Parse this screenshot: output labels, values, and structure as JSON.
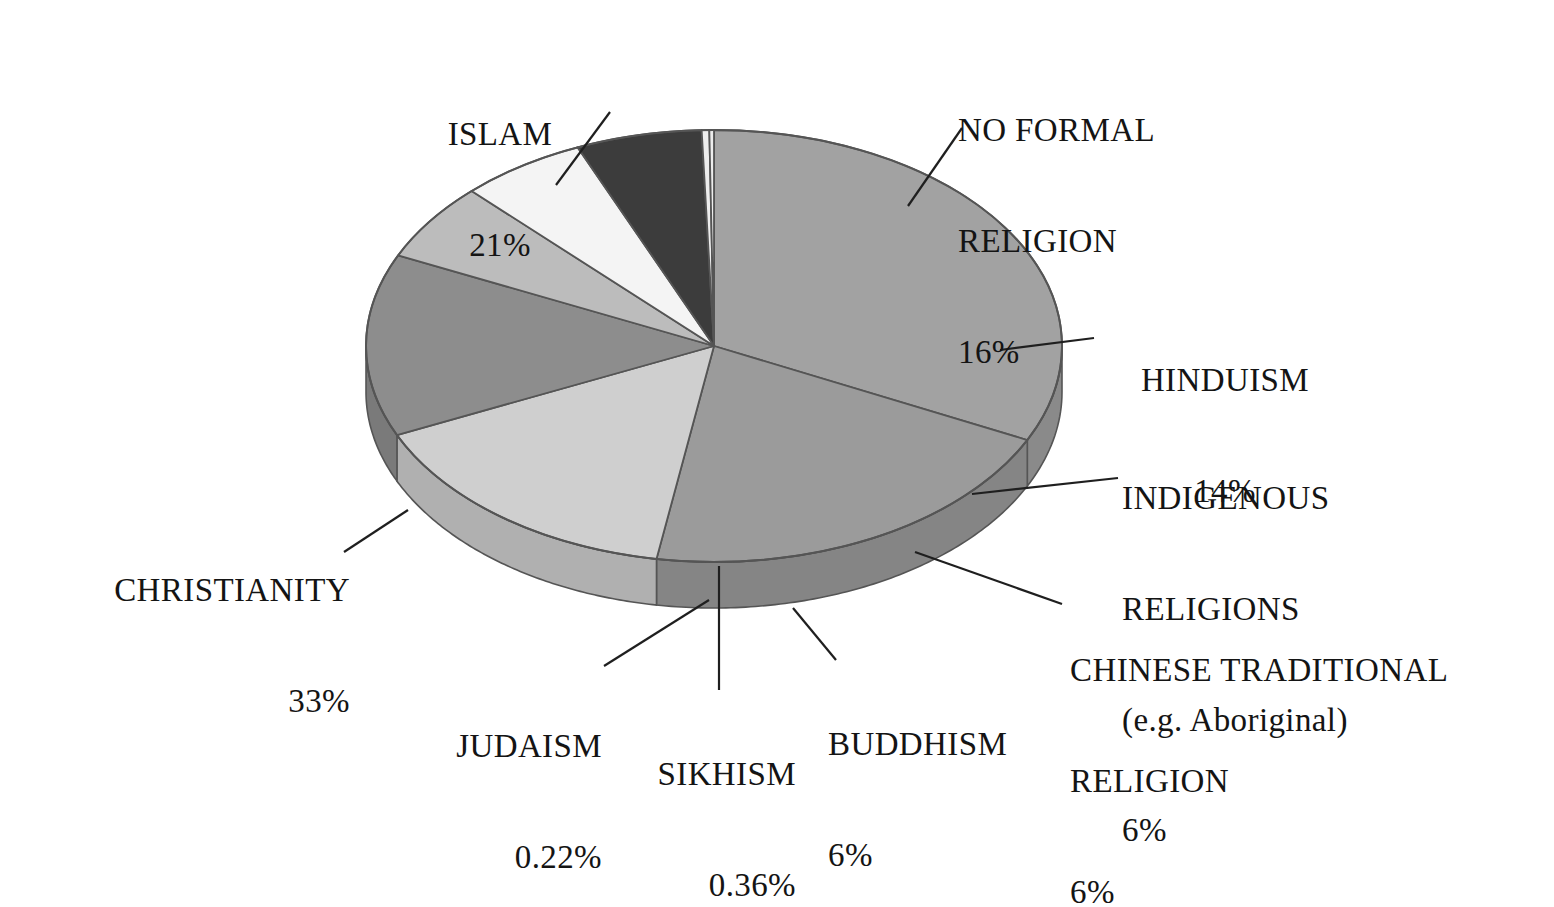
{
  "chart_data": {
    "type": "pie",
    "title": "",
    "subtitle": "",
    "xlabel": "",
    "ylabel": "",
    "legend_position": "none",
    "grid": false,
    "style": "3d-exploded-none",
    "value_unit": "%",
    "categories": [
      "ISLAM",
      "NO FORMAL RELIGION",
      "HINDUISM",
      "INDIGENOUS RELIGIONS (e.g. Aboriginal)",
      "CHINESE TRADITIONAL RELIGION",
      "BUDDHISM",
      "SIKHISM",
      "JUDAISM",
      "CHRISTIANITY"
    ],
    "values": [
      21,
      16,
      14,
      6,
      6,
      6,
      0.36,
      0.22,
      33
    ],
    "labels_text": [
      "21%",
      "16%",
      "14%",
      "6%",
      "6%",
      "6%",
      "0.36%",
      "0.22%",
      "33%"
    ],
    "colors": [
      "#9b9b9b",
      "#cfcfcf",
      "#8d8d8d",
      "#f4f4f4",
      "#bcbcbc",
      "#3c3c3c",
      "#ededed",
      "#ededed",
      "#a2a2a2"
    ],
    "slices": [
      {
        "id": "christianity",
        "name": "CHRISTIANITY",
        "value": 33,
        "label": "33%",
        "color": "#a2a2a2",
        "side_color": "#8a8a8a"
      },
      {
        "id": "islam",
        "name": "ISLAM",
        "value": 21,
        "label": "21%",
        "color": "#9b9b9b",
        "side_color": "#858585"
      },
      {
        "id": "noformal",
        "name": "NO FORMAL RELIGION",
        "value": 16,
        "label": "16%",
        "color": "#cfcfcf",
        "side_color": "#b0b0b0"
      },
      {
        "id": "hinduism",
        "name": "HINDUISM",
        "value": 14,
        "label": "14%",
        "color": "#8d8d8d",
        "side_color": "#7a7a7a"
      },
      {
        "id": "chinese",
        "name": "CHINESE TRADITIONAL RELIGION",
        "value": 6,
        "label": "6%",
        "color": "#bcbcbc",
        "side_color": "#a3a3a3"
      },
      {
        "id": "indigenous",
        "name": "INDIGENOUS RELIGIONS (e.g. Aboriginal)",
        "value": 6,
        "label": "6%",
        "color": "#f4f4f4",
        "side_color": "#d4d4d4"
      },
      {
        "id": "buddhism",
        "name": "BUDDHISM",
        "value": 6,
        "label": "6%",
        "color": "#3c3c3c",
        "side_color": "#0e0e0e"
      },
      {
        "id": "sikhism",
        "name": "SIKHISM",
        "value": 0.36,
        "label": "0.36%",
        "color": "#ededed",
        "side_color": "#cfcfcf"
      },
      {
        "id": "judaism",
        "name": "JUDAISM",
        "value": 0.22,
        "label": "0.22%",
        "color": "#ededed",
        "side_color": "#cfcfcf"
      }
    ],
    "geometry": {
      "cx": 714,
      "cy": 346,
      "rx": 348,
      "ry": 216,
      "depth": 46,
      "start_angle_deg": -90,
      "direction": "clockwise"
    }
  },
  "labels": {
    "islam": {
      "name": "ISLAM",
      "pct": "21%"
    },
    "noformal": {
      "line1": "NO FORMAL",
      "line2": "RELIGION",
      "pct": "16%"
    },
    "hinduism": {
      "name": "HINDUISM",
      "pct": "14%"
    },
    "indigenous": {
      "line1": "INDIGENOUS",
      "line2": "RELIGIONS",
      "line3": "(e.g. Aboriginal)",
      "pct": "6%"
    },
    "chinese": {
      "line1": "CHINESE TRADITIONAL",
      "line2": "RELIGION",
      "pct": "6%"
    },
    "buddhism": {
      "name": "BUDDHISM",
      "pct": "6%"
    },
    "sikhism": {
      "name": "SIKHISM",
      "pct": "0.36%"
    },
    "judaism": {
      "name": "JUDAISM",
      "pct": "0.22%"
    },
    "christianity": {
      "name": "CHRISTIANITY",
      "pct": "33%"
    }
  },
  "colors": {
    "background": "#ffffff",
    "text": "#141414",
    "outline": "#555555",
    "leader_line": "#1f1f1f"
  }
}
